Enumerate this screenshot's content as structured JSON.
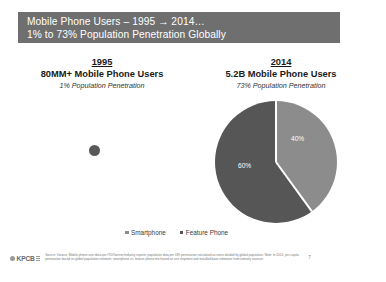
{
  "slide": {
    "title_line_1": "Mobile Phone Users – 1995 → 2014…",
    "title_line_2": "1% to 73% Population Penetration Globally",
    "banner_color": "#6f6f6f"
  },
  "panels": {
    "left": {
      "year": "1995",
      "headline": "80MM+ Mobile Phone Users",
      "subline": "1% Population Penetration"
    },
    "right": {
      "year": "2014",
      "headline": "5.2B Mobile Phone Users",
      "subline": "73% Population Penetration"
    }
  },
  "legend": {
    "items": [
      {
        "label": "Smartphone",
        "color": "#8c8c8c"
      },
      {
        "label": "Feature Phone",
        "color": "#565656"
      }
    ]
  },
  "footer": {
    "logo_text": "KPCB",
    "source": "Source: Various; Mobile phone user data per ITU/Gartner/industry reports; population data per UN; penetration calculated as users divided by global population. Note: In 2014, per-capita penetration based on global population estimate; smartphone vs. feature phone mix based on unit shipment and installed base estimates from industry sources.",
    "page_number": "7"
  },
  "chart_data": [
    {
      "type": "pie",
      "title": "1995",
      "subtitle": "80MM+ Mobile Phone Users / 1% Population Penetration",
      "categories": [
        "Feature Phone"
      ],
      "values": [
        100
      ],
      "colors": [
        "#595959"
      ],
      "labels": [],
      "relative_size": 0.09,
      "legend_position": "bottom"
    },
    {
      "type": "pie",
      "title": "2014",
      "subtitle": "5.2B Mobile Phone Users / 73% Population Penetration",
      "categories": [
        "Smartphone",
        "Feature Phone"
      ],
      "values": [
        40,
        60
      ],
      "colors": [
        "#8c8c8c",
        "#565656"
      ],
      "labels": [
        "40%",
        "60%"
      ],
      "start_angle_deg": 0,
      "direction": "clockwise",
      "relative_size": 1.0,
      "legend_position": "bottom"
    }
  ]
}
